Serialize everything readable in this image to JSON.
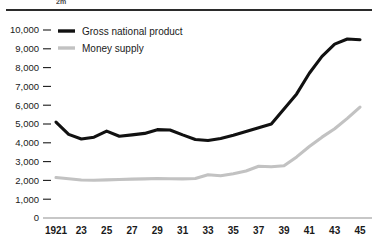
{
  "figure": {
    "clipped_caption": "2m",
    "top_rule": "horizontal-rule"
  },
  "chart_data": {
    "type": "line",
    "title": "",
    "subtitle": "",
    "xlabel": "",
    "ylabel": "",
    "xlim": [
      1921,
      1945
    ],
    "ylim": [
      0,
      10000
    ],
    "grid": false,
    "legend_position": "top-left-inside",
    "y_ticks": [
      0,
      1000,
      2000,
      3000,
      4000,
      5000,
      6000,
      7000,
      8000,
      9000,
      10000
    ],
    "y_tick_labels": [
      "0",
      "1,000",
      "2,000",
      "3,000",
      "4,000",
      "5,000",
      "6,000",
      "7,000",
      "8,000",
      "9,000",
      "10,000"
    ],
    "x_ticks": [
      1921,
      1923,
      1925,
      1927,
      1929,
      1931,
      1933,
      1935,
      1937,
      1939,
      1941,
      1943,
      1945
    ],
    "x_tick_labels": [
      "1921",
      "23",
      "25",
      "27",
      "29",
      "31",
      "33",
      "35",
      "37",
      "39",
      "41",
      "43",
      "45"
    ],
    "x": [
      1921,
      1922,
      1923,
      1924,
      1925,
      1926,
      1927,
      1928,
      1929,
      1930,
      1931,
      1932,
      1933,
      1934,
      1935,
      1936,
      1937,
      1938,
      1939,
      1940,
      1941,
      1942,
      1943,
      1944,
      1945
    ],
    "series": [
      {
        "name": "Gross national product",
        "color": "#111111",
        "values": [
          5100,
          4450,
          4200,
          4300,
          4620,
          4350,
          4420,
          4500,
          4700,
          4680,
          4420,
          4180,
          4120,
          4230,
          4400,
          4600,
          4800,
          5000,
          5800,
          6600,
          7700,
          8600,
          9250,
          9520,
          9480
        ]
      },
      {
        "name": "Money supply",
        "color": "#c2c2c2",
        "values": [
          2150,
          2090,
          2020,
          2010,
          2030,
          2050,
          2070,
          2080,
          2100,
          2090,
          2080,
          2100,
          2300,
          2250,
          2350,
          2500,
          2750,
          2730,
          2780,
          3250,
          3800,
          4300,
          4750,
          5300,
          5900
        ]
      }
    ],
    "legend": [
      {
        "label": "Gross national product",
        "color": "#111111"
      },
      {
        "label": "Money supply",
        "color": "#c2c2c2"
      }
    ]
  }
}
